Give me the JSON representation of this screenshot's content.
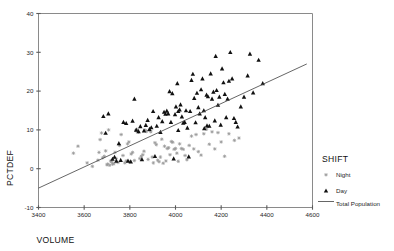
{
  "chart_data": {
    "type": "scatter",
    "title": "",
    "xlabel": "VOLUME",
    "ylabel": "PCTDEF",
    "xlim": [
      3400,
      4600
    ],
    "ylim": [
      -10,
      40
    ],
    "xticks": [
      3400,
      3600,
      3800,
      4000,
      4200,
      4400,
      4600
    ],
    "yticks": [
      -10,
      0,
      10,
      20,
      30,
      40
    ],
    "grid": false,
    "legend": {
      "title": "SHIFT",
      "position": "right",
      "entries": [
        {
          "label": "Night",
          "marker": "asterisk-marker",
          "color": "#9a9a9a"
        },
        {
          "label": "Day",
          "marker": "triangle-marker",
          "color": "#111111"
        },
        {
          "label": "Total Population",
          "marker": "line-marker",
          "color": "#4a4a4a"
        }
      ]
    },
    "fit_line": {
      "name": "Total Population",
      "x": [
        3400,
        4575
      ],
      "y": [
        -5.0,
        27.0
      ],
      "slope": 0.0272,
      "intercept": -97.6
    },
    "series": [
      {
        "name": "Night",
        "marker": "asterisk-marker",
        "color": "#9a9a9a",
        "points": [
          [
            3553,
            4.0
          ],
          [
            3573,
            5.8
          ],
          [
            3613,
            1.5
          ],
          [
            3636,
            0.6
          ],
          [
            3660,
            2.2
          ],
          [
            3665,
            4.2
          ],
          [
            3670,
            7.5
          ],
          [
            3676,
            9.2
          ],
          [
            3681,
            2.8
          ],
          [
            3688,
            3.2
          ],
          [
            3694,
            4.6
          ],
          [
            3700,
            1.0
          ],
          [
            3703,
            1.2
          ],
          [
            3707,
            10.0
          ],
          [
            3712,
            0.9
          ],
          [
            3716,
            2.0
          ],
          [
            3720,
            1.8
          ],
          [
            3724,
            1.2
          ],
          [
            3730,
            1.3
          ],
          [
            3735,
            4.2
          ],
          [
            3740,
            2.6
          ],
          [
            3748,
            1.6
          ],
          [
            3755,
            6.0
          ],
          [
            3762,
            8.8
          ],
          [
            3770,
            3.4
          ],
          [
            3778,
            1.5
          ],
          [
            3784,
            2.0
          ],
          [
            3790,
            6.4
          ],
          [
            3796,
            6.9
          ],
          [
            3800,
            1.8
          ],
          [
            3806,
            3.8
          ],
          [
            3812,
            4.2
          ],
          [
            3820,
            2.1
          ],
          [
            3826,
            9.8
          ],
          [
            3832,
            10.1
          ],
          [
            3838,
            9.4
          ],
          [
            3844,
            2.6
          ],
          [
            3850,
            3.2
          ],
          [
            3857,
            3.6
          ],
          [
            3862,
            4.5
          ],
          [
            3868,
            9.9
          ],
          [
            3873,
            9.6
          ],
          [
            3880,
            2.4
          ],
          [
            3886,
            9.9
          ],
          [
            3892,
            9.5
          ],
          [
            3898,
            3.0
          ],
          [
            3903,
            1.5
          ],
          [
            3910,
            6.7
          ],
          [
            3916,
            6.2
          ],
          [
            3922,
            2.2
          ],
          [
            3928,
            1.8
          ],
          [
            3934,
            3.0
          ],
          [
            3940,
            7.6
          ],
          [
            3946,
            1.4
          ],
          [
            3952,
            5.8
          ],
          [
            3958,
            2.0
          ],
          [
            3964,
            5.2
          ],
          [
            3970,
            5.4
          ],
          [
            3976,
            3.6
          ],
          [
            3982,
            7.0
          ],
          [
            3988,
            6.8
          ],
          [
            3994,
            5.0
          ],
          [
            4000,
            5.2
          ],
          [
            4006,
            4.0
          ],
          [
            4012,
            1.9
          ],
          [
            4018,
            6.4
          ],
          [
            4026,
            5.2
          ],
          [
            4034,
            5.0
          ],
          [
            4042,
            3.4
          ],
          [
            4050,
            2.3
          ],
          [
            4060,
            6.0
          ],
          [
            4070,
            8.4
          ],
          [
            4080,
            5.1
          ],
          [
            4090,
            8.8
          ],
          [
            4100,
            4.4
          ],
          [
            4112,
            3.5
          ],
          [
            4124,
            9.0
          ],
          [
            4136,
            10.2
          ],
          [
            4148,
            6.3
          ],
          [
            4160,
            9.5
          ],
          [
            4172,
            5.1
          ],
          [
            4186,
            9.3
          ],
          [
            4200,
            6.9
          ],
          [
            4215,
            3.2
          ],
          [
            4234,
            9.0
          ],
          [
            4258,
            7.3
          ],
          [
            4278,
            7.9
          ]
        ]
      },
      {
        "name": "Day",
        "marker": "triangle-marker",
        "color": "#111111",
        "points": [
          [
            3684,
            13.5
          ],
          [
            3694,
            9.2
          ],
          [
            3706,
            14.2
          ],
          [
            3724,
            2.5
          ],
          [
            3733,
            3.0
          ],
          [
            3741,
            2.0
          ],
          [
            3752,
            6.5
          ],
          [
            3760,
            2.2
          ],
          [
            3772,
            12.0
          ],
          [
            3784,
            11.7
          ],
          [
            3792,
            2.0
          ],
          [
            3804,
            1.8
          ],
          [
            3812,
            12.3
          ],
          [
            3820,
            18.0
          ],
          [
            3828,
            10.0
          ],
          [
            3838,
            9.6
          ],
          [
            3846,
            10.9
          ],
          [
            3853,
            2.4
          ],
          [
            3862,
            9.8
          ],
          [
            3870,
            11.2
          ],
          [
            3878,
            12.5
          ],
          [
            3886,
            10.2
          ],
          [
            3894,
            10.6
          ],
          [
            3902,
            14.8
          ],
          [
            3910,
            3.2
          ],
          [
            3918,
            11.0
          ],
          [
            3926,
            13.2
          ],
          [
            3934,
            9.4
          ],
          [
            3942,
            12.2
          ],
          [
            3950,
            14.6
          ],
          [
            3956,
            14.1
          ],
          [
            3962,
            14.9
          ],
          [
            3968,
            14.2
          ],
          [
            3974,
            19.9
          ],
          [
            3980,
            12.0
          ],
          [
            3986,
            19.4
          ],
          [
            3992,
            2.6
          ],
          [
            3998,
            14.0
          ],
          [
            4002,
            16.0
          ],
          [
            4008,
            22.0
          ],
          [
            4012,
            14.8
          ],
          [
            4018,
            15.2
          ],
          [
            4022,
            16.5
          ],
          [
            4028,
            13.4
          ],
          [
            4034,
            11.8
          ],
          [
            4040,
            12.0
          ],
          [
            4046,
            15.0
          ],
          [
            4052,
            10.5
          ],
          [
            4058,
            3.1
          ],
          [
            4064,
            14.8
          ],
          [
            4070,
            22.8
          ],
          [
            4076,
            24.4
          ],
          [
            4082,
            18.2
          ],
          [
            4088,
            11.9
          ],
          [
            4094,
            19.5
          ],
          [
            4100,
            15.8
          ],
          [
            4106,
            14.2
          ],
          [
            4112,
            20.4
          ],
          [
            4118,
            23.2
          ],
          [
            4124,
            15.0
          ],
          [
            4130,
            13.2
          ],
          [
            4136,
            19.0
          ],
          [
            4142,
            18.6
          ],
          [
            4148,
            11.0
          ],
          [
            4154,
            24.5
          ],
          [
            4160,
            18.0
          ],
          [
            4166,
            19.8
          ],
          [
            4172,
            12.4
          ],
          [
            4176,
            29.0
          ],
          [
            4180,
            20.2
          ],
          [
            4186,
            16.4
          ],
          [
            4192,
            18.5
          ],
          [
            4198,
            11.3
          ],
          [
            4204,
            25.8
          ],
          [
            4210,
            22.2
          ],
          [
            4216,
            19.2
          ],
          [
            4222,
            13.2
          ],
          [
            4228,
            18.0
          ],
          [
            4234,
            22.6
          ],
          [
            4240,
            30.0
          ],
          [
            4248,
            23.2
          ],
          [
            4256,
            13.0
          ],
          [
            4264,
            12.0
          ],
          [
            4272,
            10.8
          ],
          [
            4286,
            16.0
          ],
          [
            4300,
            18.5
          ],
          [
            4316,
            24.0
          ],
          [
            4326,
            29.6
          ],
          [
            4340,
            19.6
          ],
          [
            4364,
            28.0
          ],
          [
            4382,
            22.0
          ],
          [
            4012,
            9.9
          ],
          [
            4126,
            10.4
          ],
          [
            4138,
            11.1
          ]
        ]
      }
    ]
  }
}
